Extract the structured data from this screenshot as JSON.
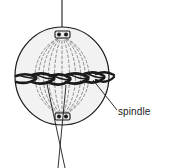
{
  "figure": {
    "background_color": "#ffffff"
  },
  "cell": {
    "name": "cell-body",
    "fill_color": "#f2f2f2",
    "outline_color": "#1a1a1a",
    "center_x": 62,
    "center_y": 76,
    "radius_x": 47,
    "radius_y": 49
  },
  "poles": {
    "top": {
      "label": "centriole",
      "x": 62,
      "y": 35,
      "color": "#1a1a1a"
    },
    "bottom": {
      "label": "centriole",
      "x": 62,
      "y": 117,
      "color": "#1a1a1a"
    }
  },
  "spindle_fibers": {
    "count": 11,
    "style": "dashed",
    "color": "#8c8c8c"
  },
  "chromosomes": {
    "count": 6,
    "color": "#1a1a1a",
    "arrangement": "equatorial-plate"
  },
  "leader_lines": {
    "spindle_pointer": {
      "from_x": 93,
      "from_y": 80,
      "to_x": 116,
      "to_y": 110
    },
    "chromosome_pointer_left": {
      "from_x": 47,
      "from_y": 84,
      "to_x": 64,
      "to_y": 166
    },
    "chromosome_pointer_right": {
      "from_x": 66,
      "from_y": 85,
      "to_x": 59,
      "to_y": 166
    },
    "top_axis": {
      "from_x": 62,
      "from_y": 0,
      "to_x": 62,
      "to_y": 35
    }
  },
  "labels": {
    "spindle": "spindle"
  }
}
